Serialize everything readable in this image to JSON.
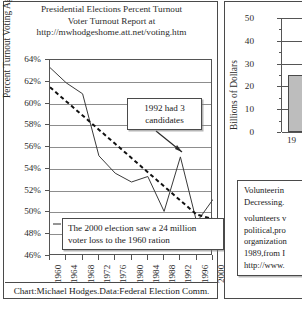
{
  "left_chart": {
    "title_lines": [
      "Presidential Elections Percent Turnout",
      "Voter Turnout Report at",
      "http://mwhodgeshome.att.net/voting.htm"
    ],
    "footer": "Chart:Michael Hodges.Data:Federal Election Comm.",
    "callout_1_line1": "1992 had 3",
    "callout_1_line2": "candidates",
    "callout_2_line1": "The 2000 election saw a 24 million",
    "callout_2_line2": "voter loss to the 1960 ration"
  },
  "right_chart": {
    "ylabel": "Billions of Dollars",
    "xtick": "19"
  },
  "side_text": {
    "lead_line1": "Volunteerin",
    "lead_line2": "Decressing.",
    "body_lines": [
      "volunteers v",
      "political,pro",
      "organization",
      "1989,from I",
      "http://www."
    ]
  },
  "chart_data": [
    {
      "type": "line",
      "title": "Presidential Elections Percent Turnout",
      "xlabel": "",
      "ylabel": "Percent Turnout Voting Age Population",
      "categories": [
        "1960",
        "1964",
        "1968",
        "1972",
        "1976",
        "1980",
        "1984",
        "1988",
        "1992",
        "1996",
        "2000"
      ],
      "xlim": [
        1960,
        2000
      ],
      "ylim": [
        46,
        64
      ],
      "yticks": [
        "46%",
        "48%",
        "50%",
        "52%",
        "54%",
        "56%",
        "58%",
        "60%",
        "62%",
        "64%"
      ],
      "grid": true,
      "legend": "none",
      "series": [
        {
          "name": "Percent Turnout",
          "style": "solid",
          "values": [
            63.3,
            61.9,
            60.9,
            55.2,
            53.6,
            52.8,
            53.3,
            50.1,
            55.1,
            49.1,
            51.2
          ]
        },
        {
          "name": "Trend",
          "style": "dashed",
          "values": [
            61.5,
            60.2,
            58.9,
            57.6,
            56.3,
            55.0,
            53.7,
            52.4,
            51.1,
            49.8,
            49.4
          ]
        }
      ],
      "annotations": [
        "1992 had 3 candidates",
        "The 2000 election saw a 24 million voter loss to the 1960 ration"
      ]
    },
    {
      "type": "bar",
      "title": "",
      "xlabel": "",
      "ylabel": "Billions of Dollars",
      "categories": [
        "19"
      ],
      "values": [
        25
      ],
      "ylim": [
        0,
        50
      ],
      "yticks": [
        "0",
        "10",
        "20",
        "30",
        "40",
        "50"
      ],
      "grid": true
    }
  ]
}
